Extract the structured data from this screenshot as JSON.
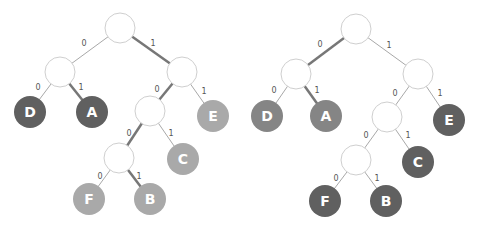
{
  "colors": {
    "dark": "#606060",
    "mid": "#858585",
    "light": "#a9a9a9",
    "node_fill": "#ffffff",
    "node_stroke": "#cfcfcf"
  },
  "trees": [
    {
      "name": "tree-left",
      "internal_nodes": [
        {
          "id": "root",
          "x": 120,
          "y": 28
        },
        {
          "id": "n0",
          "x": 60,
          "y": 72
        },
        {
          "id": "n1",
          "x": 182,
          "y": 72
        },
        {
          "id": "n10",
          "x": 150,
          "y": 111
        },
        {
          "id": "n100",
          "x": 119,
          "y": 158
        }
      ],
      "leaves": [
        {
          "label": "D",
          "code": "00",
          "x": 30,
          "y": 112,
          "color": "#606060"
        },
        {
          "label": "A",
          "code": "01",
          "x": 92,
          "y": 112,
          "color": "#606060"
        },
        {
          "label": "E",
          "code": "11",
          "x": 213,
          "y": 116,
          "color": "#a9a9a9"
        },
        {
          "label": "C",
          "code": "101",
          "x": 183,
          "y": 159,
          "color": "#a9a9a9"
        },
        {
          "label": "F",
          "code": "1000",
          "x": 89,
          "y": 199,
          "color": "#a9a9a9"
        },
        {
          "label": "B",
          "code": "1001",
          "x": 150,
          "y": 199,
          "color": "#a9a9a9"
        }
      ],
      "edges": [
        {
          "from": [
            120,
            28
          ],
          "to": [
            60,
            72
          ],
          "label": "0",
          "lx": 84,
          "ly": 46,
          "bold": false
        },
        {
          "from": [
            120,
            28
          ],
          "to": [
            182,
            72
          ],
          "label": "1",
          "lx": 153,
          "ly": 46,
          "bold": true
        },
        {
          "from": [
            60,
            72
          ],
          "to": [
            30,
            112
          ],
          "label": "0",
          "lx": 38,
          "ly": 90,
          "bold": false
        },
        {
          "from": [
            60,
            72
          ],
          "to": [
            92,
            112
          ],
          "label": "1",
          "lx": 81,
          "ly": 90,
          "bold": true
        },
        {
          "from": [
            182,
            72
          ],
          "to": [
            150,
            111
          ],
          "label": "0",
          "lx": 157,
          "ly": 92,
          "bold": true
        },
        {
          "from": [
            182,
            72
          ],
          "to": [
            213,
            116
          ],
          "label": "1",
          "lx": 204,
          "ly": 94,
          "bold": false
        },
        {
          "from": [
            150,
            111
          ],
          "to": [
            119,
            158
          ],
          "label": "0",
          "lx": 129,
          "ly": 136,
          "bold": true
        },
        {
          "from": [
            150,
            111
          ],
          "to": [
            183,
            159
          ],
          "label": "1",
          "lx": 171,
          "ly": 136,
          "bold": false
        },
        {
          "from": [
            119,
            158
          ],
          "to": [
            89,
            199
          ],
          "label": "0",
          "lx": 100,
          "ly": 179,
          "bold": false
        },
        {
          "from": [
            119,
            158
          ],
          "to": [
            150,
            199
          ],
          "label": "1",
          "lx": 139,
          "ly": 179,
          "bold": true
        }
      ]
    },
    {
      "name": "tree-right",
      "internal_nodes": [
        {
          "id": "root",
          "x": 356,
          "y": 29
        },
        {
          "id": "n0",
          "x": 296,
          "y": 74
        },
        {
          "id": "n1",
          "x": 418,
          "y": 74
        },
        {
          "id": "n10",
          "x": 387,
          "y": 117
        },
        {
          "id": "n100",
          "x": 356,
          "y": 160
        }
      ],
      "leaves": [
        {
          "label": "D",
          "code": "00",
          "x": 267,
          "y": 116,
          "color": "#858585"
        },
        {
          "label": "A",
          "code": "01",
          "x": 326,
          "y": 116,
          "color": "#858585"
        },
        {
          "label": "E",
          "code": "11",
          "x": 449,
          "y": 120,
          "color": "#606060"
        },
        {
          "label": "C",
          "code": "101",
          "x": 418,
          "y": 162,
          "color": "#606060"
        },
        {
          "label": "F",
          "code": "1000",
          "x": 325,
          "y": 201,
          "color": "#606060"
        },
        {
          "label": "B",
          "code": "1001",
          "x": 386,
          "y": 201,
          "color": "#606060"
        }
      ],
      "edges": [
        {
          "from": [
            356,
            29
          ],
          "to": [
            296,
            74
          ],
          "label": "0",
          "lx": 320,
          "ly": 47,
          "bold": true
        },
        {
          "from": [
            356,
            29
          ],
          "to": [
            418,
            74
          ],
          "label": "1",
          "lx": 389,
          "ly": 48,
          "bold": false
        },
        {
          "from": [
            296,
            74
          ],
          "to": [
            267,
            116
          ],
          "label": "0",
          "lx": 274,
          "ly": 93,
          "bold": false
        },
        {
          "from": [
            296,
            74
          ],
          "to": [
            326,
            116
          ],
          "label": "1",
          "lx": 317,
          "ly": 93,
          "bold": true
        },
        {
          "from": [
            418,
            74
          ],
          "to": [
            387,
            117
          ],
          "label": "0",
          "lx": 395,
          "ly": 96,
          "bold": false
        },
        {
          "from": [
            418,
            74
          ],
          "to": [
            449,
            120
          ],
          "label": "1",
          "lx": 440,
          "ly": 96,
          "bold": false
        },
        {
          "from": [
            387,
            117
          ],
          "to": [
            356,
            160
          ],
          "label": "0",
          "lx": 366,
          "ly": 138,
          "bold": false
        },
        {
          "from": [
            387,
            117
          ],
          "to": [
            418,
            162
          ],
          "label": "1",
          "lx": 408,
          "ly": 138,
          "bold": false
        },
        {
          "from": [
            356,
            160
          ],
          "to": [
            325,
            201
          ],
          "label": "0",
          "lx": 336,
          "ly": 181,
          "bold": false
        },
        {
          "from": [
            356,
            160
          ],
          "to": [
            386,
            201
          ],
          "label": "1",
          "lx": 377,
          "ly": 181,
          "bold": false
        }
      ]
    }
  ]
}
